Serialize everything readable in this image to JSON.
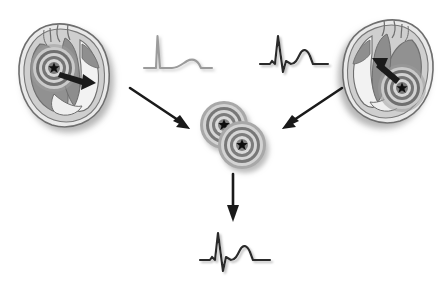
{
  "figure": {
    "background_color": "#ffffff",
    "width": 446,
    "height": 290
  },
  "palette": {
    "heart_outline": "#6e6e6e",
    "heart_muscle_dark": "#8f8f8f",
    "heart_chamber_light": "#e4e4e4",
    "heart_wall_mid": "#c9c9c9",
    "shadow": "#bfbfbf",
    "target_ring_dark": "#5a5a5a",
    "target_ring_light": "#d8d8d8",
    "target_star": "#111111",
    "arrow_black": "#1a1a1a",
    "ecg_light": "#9a9a9a",
    "ecg_dark": "#2a2a2a"
  },
  "elements": {
    "heart_left": {
      "name": "Left heart cross-section",
      "focus_label": "Focus A",
      "focus_position": "septal / left side",
      "activation_arrow_direction": "rightward",
      "x": 10,
      "y": 18,
      "w": 112,
      "h": 112,
      "mirrored": false
    },
    "heart_right": {
      "name": "Right heart cross-section",
      "focus_label": "Focus B",
      "focus_position": "lateral / lower right",
      "activation_arrow_direction": "up-left",
      "x": 330,
      "y": 14,
      "w": 112,
      "h": 112,
      "mirrored": true
    },
    "ecg_left": {
      "name": "ECG complex from focus A",
      "shade": "light",
      "description": "tall narrow R spike followed by flat baseline and small rounded T wave",
      "x": 142,
      "y": 32,
      "w": 68,
      "h": 44
    },
    "ecg_right": {
      "name": "ECG complex from focus B",
      "shade": "dark",
      "description": "sharp QRS with deep S followed by rounded T wave",
      "x": 258,
      "y": 30,
      "w": 68,
      "h": 48
    },
    "ecg_fusion": {
      "name": "Fusion ECG complex",
      "shade": "dark",
      "description": "combined QRS morphology with deep S and rounded T wave",
      "x": 198,
      "y": 228,
      "w": 72,
      "h": 48
    },
    "targets_center": {
      "name": "Overlapping dual foci",
      "count": 2,
      "arrangement": "diagonal overlap, upper-left and lower-right",
      "x": 196,
      "y": 100,
      "w": 72,
      "h": 68
    },
    "arrow_left_to_center": {
      "name": "Arrow from left heart to center",
      "direction": "down-right",
      "x1": 130,
      "y1": 88,
      "x2": 196,
      "y2": 132
    },
    "arrow_right_to_center": {
      "name": "Arrow from right heart to center",
      "direction": "down-left",
      "x1": 338,
      "y1": 88,
      "x2": 272,
      "y2": 132
    },
    "arrow_center_to_ecg": {
      "name": "Arrow from center foci down to fusion ECG",
      "direction": "down",
      "x1": 232,
      "y1": 176,
      "x2": 232,
      "y2": 222
    }
  }
}
